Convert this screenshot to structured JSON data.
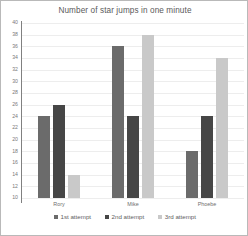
{
  "chart_data": {
    "type": "bar",
    "title": "Number of star jumps in one minute",
    "xlabel": "",
    "ylabel": "",
    "categories": [
      "Rory",
      "Mike",
      "Phoebe"
    ],
    "series": [
      {
        "name": "1st attempt",
        "color": "#6b6b6b",
        "values": [
          24,
          36,
          18
        ]
      },
      {
        "name": "2nd attempt",
        "color": "#464646",
        "values": [
          26,
          24,
          24
        ]
      },
      {
        "name": "3rd attempt",
        "color": "#c9c9c9",
        "values": [
          14,
          38,
          34
        ]
      }
    ],
    "ylim": [
      10,
      40
    ],
    "ytick_step": 2,
    "yticks": [
      10,
      12,
      14,
      16,
      18,
      20,
      22,
      24,
      26,
      28,
      30,
      32,
      34,
      36,
      38,
      40
    ],
    "ytick_labels": [
      "10",
      "12",
      "14",
      "16",
      "18",
      "20",
      "22",
      "24",
      "26",
      "28",
      "30",
      "32",
      "34",
      "36",
      "38",
      "40"
    ],
    "grid": true,
    "legend_position": "bottom"
  }
}
